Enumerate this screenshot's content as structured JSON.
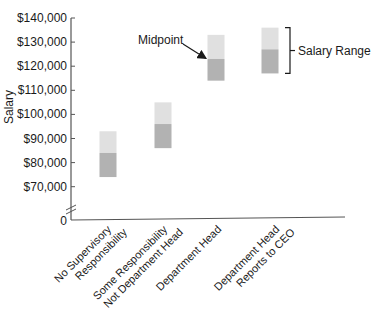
{
  "chart_data": {
    "type": "bar",
    "subtype": "floating-range",
    "title": "",
    "xlabel": "",
    "ylabel": "Salary",
    "ylim": [
      70000,
      140000
    ],
    "axis_break": true,
    "grid": false,
    "y_ticks": [
      {
        "value": 140000,
        "label": "$140,000"
      },
      {
        "value": 130000,
        "label": "$130,000"
      },
      {
        "value": 120000,
        "label": "$120,000"
      },
      {
        "value": 110000,
        "label": "$110,000"
      },
      {
        "value": 100000,
        "label": "$100,000"
      },
      {
        "value": 90000,
        "label": "$90,000"
      },
      {
        "value": 80000,
        "label": "$80,000"
      },
      {
        "value": 70000,
        "label": "$70,000"
      }
    ],
    "zero_label": "0",
    "categories": [
      [
        "No Supervisory",
        "Responsibility"
      ],
      [
        "Some Responsibility",
        "Not Department Head"
      ],
      [
        "Department Head"
      ],
      [
        "Department Head",
        "Reports to CEO"
      ]
    ],
    "series": [
      {
        "name": "Minimum",
        "values": [
          74000,
          86000,
          114000,
          117000
        ]
      },
      {
        "name": "Midpoint",
        "values": [
          84000,
          96000,
          123000,
          127000
        ]
      },
      {
        "name": "Maximum",
        "values": [
          93000,
          105000,
          133000,
          136000
        ]
      }
    ],
    "annotations": [
      {
        "text": "Midpoint",
        "target_category": 2,
        "type": "arrow"
      },
      {
        "text": "Salary Range",
        "target_category": 3,
        "type": "bracket"
      }
    ],
    "colors": {
      "upper_segment": "#e0e0e0",
      "lower_segment": "#b2b2b2",
      "axis": "#555555",
      "text": "#1a1a1a"
    }
  }
}
